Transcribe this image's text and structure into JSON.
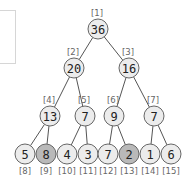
{
  "diagram": {
    "type": "binary-tree",
    "colors": {
      "node_fill": "#ececec",
      "highlight_fill": "#b9b9b9",
      "stroke": "#666666",
      "edge": "#555555"
    },
    "nodes": [
      {
        "index": "[1]",
        "value": "36",
        "x": 98,
        "y": 29,
        "highlight": false
      },
      {
        "index": "[2]",
        "value": "20",
        "x": 74,
        "y": 68,
        "highlight": false
      },
      {
        "index": "[3]",
        "value": "16",
        "x": 129,
        "y": 68,
        "highlight": false
      },
      {
        "index": "[4]",
        "value": "13",
        "x": 50,
        "y": 116,
        "highlight": false
      },
      {
        "index": "[5]",
        "value": "7",
        "x": 85,
        "y": 116,
        "highlight": false
      },
      {
        "index": "[6]",
        "value": "9",
        "x": 114,
        "y": 116,
        "highlight": false
      },
      {
        "index": "[7]",
        "value": "7",
        "x": 154,
        "y": 116,
        "highlight": false
      },
      {
        "index": "[8]",
        "value": "5",
        "x": 25,
        "y": 154,
        "highlight": false
      },
      {
        "index": "[9]",
        "value": "8",
        "x": 46,
        "y": 154,
        "highlight": true
      },
      {
        "index": "[10]",
        "value": "4",
        "x": 67,
        "y": 154,
        "highlight": false
      },
      {
        "index": "[11]",
        "value": "3",
        "x": 88,
        "y": 154,
        "highlight": false
      },
      {
        "index": "[12]",
        "value": "7",
        "x": 108,
        "y": 154,
        "highlight": false
      },
      {
        "index": "[13]",
        "value": "2",
        "x": 129,
        "y": 154,
        "highlight": true
      },
      {
        "index": "[14]",
        "value": "1",
        "x": 150,
        "y": 154,
        "highlight": false
      },
      {
        "index": "[15]",
        "value": "6",
        "x": 171,
        "y": 154,
        "highlight": false
      }
    ],
    "edges": [
      [
        0,
        1
      ],
      [
        0,
        2
      ],
      [
        1,
        3
      ],
      [
        1,
        4
      ],
      [
        2,
        5
      ],
      [
        2,
        6
      ],
      [
        3,
        7
      ],
      [
        3,
        8
      ],
      [
        4,
        9
      ],
      [
        4,
        10
      ],
      [
        5,
        11
      ],
      [
        5,
        12
      ],
      [
        6,
        13
      ],
      [
        6,
        14
      ]
    ]
  }
}
